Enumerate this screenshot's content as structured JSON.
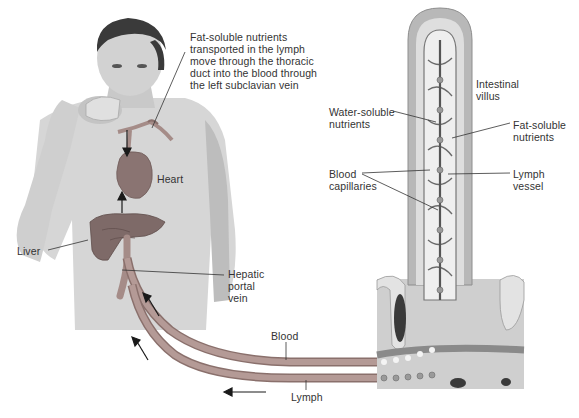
{
  "diagram": {
    "colors": {
      "vessel": "#a58c88",
      "vessel_edge": "#8a706c",
      "skin": "#d9d9d9",
      "shirt": "#cfcfcf",
      "hair": "#3a3a3a",
      "organ": "#7e6a68",
      "villus_outer": "#b8b8b8",
      "villus_inner": "#e6e6e6",
      "leader": "#333333",
      "arrow": "#1a1a1a"
    },
    "labels": {
      "thoracic_note": "Fat-soluble nutrients\ntransported in the lymph\nmove through the thoracic\nduct into the blood through\nthe left subclavian vein",
      "heart": "Heart",
      "liver": "Liver",
      "hepatic_portal_vein": "Hepatic\nportal\nvein",
      "blood": "Blood",
      "lymph": "Lymph",
      "intestinal_villus": "Intestinal\nvillus",
      "water_soluble": "Water-soluble\nnutrients",
      "fat_soluble": "Fat-soluble\nnutrients",
      "blood_capillaries": "Blood\ncapillaries",
      "lymph_vessel": "Lymph\nvessel"
    },
    "flow_arrows": [
      {
        "name": "toward-heart-from-neck",
        "direction": "down"
      },
      {
        "name": "liver-to-heart",
        "direction": "up"
      },
      {
        "name": "blood-to-liver",
        "direction": "up-left"
      },
      {
        "name": "lymph-upward",
        "direction": "up-left"
      },
      {
        "name": "lymph-leftward",
        "direction": "left"
      }
    ]
  }
}
